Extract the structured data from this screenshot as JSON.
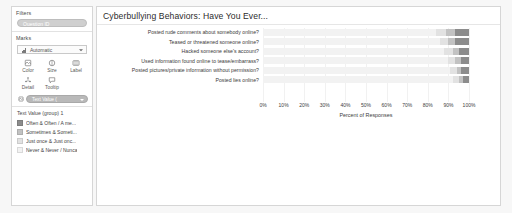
{
  "sidebar": {
    "filters": {
      "title": "Filters",
      "pills": [
        {
          "label": "Question ID",
          "icon": "filter-pill"
        }
      ]
    },
    "marks": {
      "title": "Marks",
      "mark_type": {
        "value": "Automatic",
        "icon": "bar-chart-icon",
        "caret": "chevron-down-icon"
      },
      "buttons": [
        {
          "label": "Color",
          "icon": "color-icon"
        },
        {
          "label": "Size",
          "icon": "size-icon"
        },
        {
          "label": "Label",
          "icon": "label-icon"
        },
        {
          "label": "Detail",
          "icon": "detail-icon"
        },
        {
          "label": "Tooltip",
          "icon": "tooltip-icon"
        }
      ],
      "encoding_pills": [
        {
          "label": "Text Value (",
          "icon": "color-encoding-icon",
          "caret": "chevron-down-icon"
        }
      ]
    },
    "legend": {
      "title": "Text Value (group) 1",
      "items": [
        {
          "label": "Often & Often / A me...",
          "color": "#8c8c8c"
        },
        {
          "label": "Sometimes & Someti...",
          "color": "#c2c2c2"
        },
        {
          "label": "Just once & Just onc...",
          "color": "#e2e2e2"
        },
        {
          "label": "Never & Never / Nunca",
          "color": "#f2f2f2"
        }
      ]
    }
  },
  "viz": {
    "title": "Cyberbullying Behaviors: Have You Ever..."
  },
  "chart_data": {
    "type": "bar",
    "orientation": "horizontal",
    "stacked": true,
    "stack_mode": "percent",
    "title": "Cyberbullying Behaviors: Have You Ever...",
    "xlabel": "Percent of Responses",
    "ylabel": "",
    "xlim": [
      0,
      100
    ],
    "xtick_labels": [
      "0%",
      "10%",
      "20%",
      "30%",
      "40%",
      "50%",
      "60%",
      "70%",
      "80%",
      "90%",
      "100%"
    ],
    "xticks": [
      0,
      10,
      20,
      30,
      40,
      50,
      60,
      70,
      80,
      90,
      100
    ],
    "grid": true,
    "legend_position": "sidebar-left",
    "categories": [
      "Posted rude comments about somebody online?",
      "Teased or threatened someone online?",
      "Hacked someone else's account?",
      "Used information found online to tease/embarrass?",
      "Posted pictures/private information without permission?",
      "Posted lies online?"
    ],
    "series": [
      {
        "name": "Never & Never / Nunca",
        "color": "#f2f2f2",
        "values": [
          84,
          86,
          88,
          90,
          91,
          92
        ]
      },
      {
        "name": "Just once & Just onc...",
        "color": "#e2e2e2",
        "values": [
          5,
          4,
          4,
          3,
          3,
          3
        ]
      },
      {
        "name": "Sometimes & Someti...",
        "color": "#c2c2c2",
        "values": [
          4,
          3,
          3,
          3,
          2,
          2
        ]
      },
      {
        "name": "Often & Often / A me...",
        "color": "#8c8c8c",
        "values": [
          7,
          7,
          5,
          4,
          4,
          3
        ]
      }
    ]
  }
}
